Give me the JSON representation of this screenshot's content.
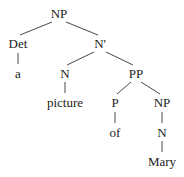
{
  "diagram": {
    "type": "syntax-tree",
    "nodes": [
      {
        "id": "np_root",
        "label": "NP",
        "x": 59,
        "y": 18
      },
      {
        "id": "det",
        "label": "Det",
        "x": 18,
        "y": 48
      },
      {
        "id": "nbar",
        "label": "N'",
        "x": 100,
        "y": 48
      },
      {
        "id": "a",
        "label": "a",
        "x": 18,
        "y": 78
      },
      {
        "id": "n1",
        "label": "N",
        "x": 65,
        "y": 78
      },
      {
        "id": "pp",
        "label": "PP",
        "x": 136,
        "y": 78
      },
      {
        "id": "picture",
        "label": "picture",
        "x": 65,
        "y": 107
      },
      {
        "id": "p",
        "label": "P",
        "x": 115,
        "y": 107
      },
      {
        "id": "np2",
        "label": "NP",
        "x": 162,
        "y": 107
      },
      {
        "id": "of",
        "label": "of",
        "x": 115,
        "y": 137
      },
      {
        "id": "n2",
        "label": "N",
        "x": 162,
        "y": 137
      },
      {
        "id": "mary",
        "label": "Mary",
        "x": 162,
        "y": 166
      }
    ],
    "edges": [
      {
        "from": "np_root",
        "to": "det",
        "x1": 52,
        "y1": 22,
        "x2": 20,
        "y2": 35
      },
      {
        "from": "np_root",
        "to": "nbar",
        "x1": 66,
        "y1": 22,
        "x2": 98,
        "y2": 35
      },
      {
        "from": "det",
        "to": "a",
        "x1": 18,
        "y1": 53,
        "x2": 18,
        "y2": 64
      },
      {
        "from": "nbar",
        "to": "n1",
        "x1": 94,
        "y1": 52,
        "x2": 67,
        "y2": 65
      },
      {
        "from": "nbar",
        "to": "pp",
        "x1": 106,
        "y1": 52,
        "x2": 133,
        "y2": 65
      },
      {
        "from": "n1",
        "to": "picture",
        "x1": 65,
        "y1": 82,
        "x2": 65,
        "y2": 93
      },
      {
        "from": "pp",
        "to": "p",
        "x1": 131,
        "y1": 82,
        "x2": 117,
        "y2": 94
      },
      {
        "from": "pp",
        "to": "np2",
        "x1": 141,
        "y1": 82,
        "x2": 160,
        "y2": 94
      },
      {
        "from": "p",
        "to": "of",
        "x1": 115,
        "y1": 112,
        "x2": 115,
        "y2": 123
      },
      {
        "from": "np2",
        "to": "n2",
        "x1": 162,
        "y1": 112,
        "x2": 162,
        "y2": 123
      },
      {
        "from": "n2",
        "to": "mary",
        "x1": 162,
        "y1": 141,
        "x2": 162,
        "y2": 152
      }
    ]
  }
}
